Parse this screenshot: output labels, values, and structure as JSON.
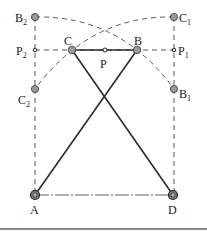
{
  "diagram": {
    "colors": {
      "line": "#2a2a2a",
      "dashed": "#444444",
      "joint_fill": "#9a9a9a",
      "base_rule": "#8a8a8a"
    },
    "points": {
      "A": {
        "label": "A",
        "sub": "",
        "x": 35,
        "y": 195
      },
      "D": {
        "label": "D",
        "sub": "",
        "x": 173,
        "y": 195
      },
      "B": {
        "label": "B",
        "sub": "",
        "x": 137,
        "y": 50
      },
      "C": {
        "label": "C",
        "sub": "",
        "x": 72,
        "y": 50
      },
      "P": {
        "label": "P",
        "sub": "",
        "x": 105,
        "y": 50
      },
      "B1": {
        "label": "B",
        "sub": "1",
        "x": 174,
        "y": 89
      },
      "B2": {
        "label": "B",
        "sub": "2",
        "x": 35,
        "y": 17
      },
      "C1": {
        "label": "C",
        "sub": "1",
        "x": 174,
        "y": 17
      },
      "C2": {
        "label": "C",
        "sub": "2",
        "x": 35,
        "y": 89
      },
      "P1": {
        "label": "P",
        "sub": "1",
        "x": 174,
        "y": 50
      },
      "P2": {
        "label": "P",
        "sub": "2",
        "x": 35,
        "y": 50
      }
    },
    "links": [
      {
        "from": "A",
        "to": "B",
        "style": "solid"
      },
      {
        "from": "D",
        "to": "C",
        "style": "solid"
      },
      {
        "from": "C",
        "to": "B",
        "style": "solid"
      },
      {
        "from": "A",
        "to": "D",
        "style": "dash-dot"
      }
    ]
  }
}
